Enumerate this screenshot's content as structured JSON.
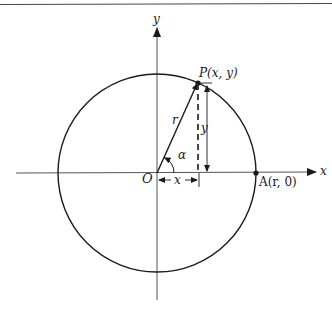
{
  "diagram": {
    "colors": {
      "ink": "#1a1a1a",
      "axis": "#555555",
      "rule": "#444444",
      "background": "#ffffff"
    },
    "geometry": {
      "origin": {
        "x": 157,
        "y": 173
      },
      "radius": 99,
      "point_P": {
        "x": 198,
        "y": 82
      },
      "point_A": {
        "x": 256,
        "y": 173
      }
    },
    "labels": {
      "y_axis": "y",
      "x_axis": "x",
      "origin": "O",
      "point_P": "P(x, y)",
      "point_A": "A(r, 0)",
      "radius": "r",
      "angle": "α",
      "x_dimension": "x",
      "y_dimension": "y"
    }
  }
}
